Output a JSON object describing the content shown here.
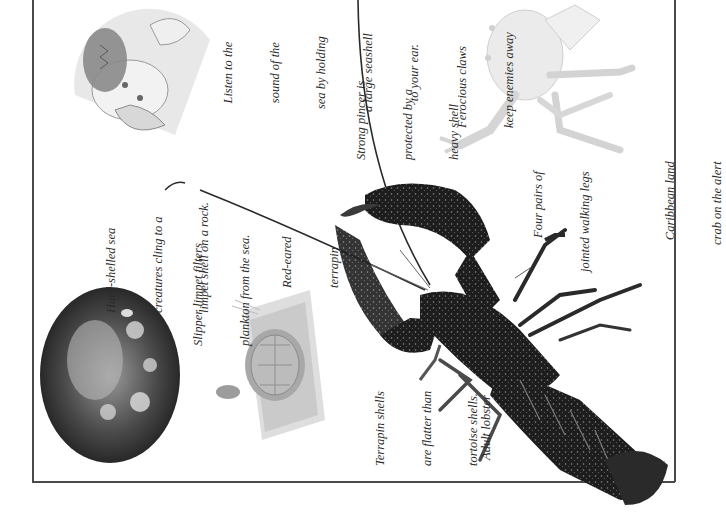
{
  "page": {
    "orientation": "rotated-90-ccw",
    "frame_color": "#4a4a4a"
  },
  "captions": {
    "limpet_rock": {
      "lines": [
        "Hard-shelled sea",
        "creatures cling to a",
        "limpet shell on a rock."
      ]
    },
    "slipper_limpet": {
      "lines": [
        "Slipper limpet filters",
        "plankton from the sea."
      ]
    },
    "red_eared": {
      "lines": [
        "Red-eared",
        "terrapin"
      ]
    },
    "terrapin_shells": {
      "lines": [
        "Terrapin shells",
        "are flatter than",
        "tortoise shells."
      ]
    },
    "seashell": {
      "lines": [
        "Listen to the",
        "sound of the",
        "sea by holding",
        "a large seashell",
        "to your ear."
      ]
    },
    "pincer": {
      "lines": [
        "Strong pincer is",
        "protected by a",
        "heavy shell"
      ]
    },
    "walking_legs": {
      "lines": [
        "Four pairs of",
        "jointed walking legs"
      ]
    },
    "adult_lobster": {
      "lines": [
        "Adult lobster"
      ]
    },
    "claws": {
      "lines": [
        "Ferocious claws",
        "keep enemies away"
      ]
    },
    "land_crab": {
      "lines": [
        "Caribbean land",
        "crab on the alert"
      ]
    }
  },
  "illustrations": {
    "limpet": "limpet-shell-on-rock",
    "terrapin": "red-eared-terrapin",
    "child": "child-listening-to-seashell",
    "lobster": "adult-lobster-photo",
    "crab": "caribbean-land-crab"
  }
}
